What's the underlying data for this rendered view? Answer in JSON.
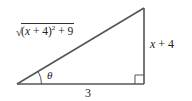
{
  "figure": {
    "type": "right-triangle",
    "labels": {
      "hypotenuse": {
        "radical_open": "√",
        "paren_open": "(",
        "var": "x",
        "plus1": " + ",
        "num": "4",
        "paren_close": ")",
        "exponent": "2",
        "plus2": " + ",
        "const": "9",
        "full_text": "√((x + 4)² + 9)"
      },
      "opposite": {
        "var": "x",
        "rest": " + 4",
        "full_text": "x + 4"
      },
      "adjacent": "3",
      "angle": "θ"
    },
    "vertices": {
      "left": [
        17,
        84
      ],
      "right_angle": [
        144,
        84
      ],
      "top": [
        144,
        8
      ]
    },
    "colors": {
      "stroke": "#555555",
      "text": "#222222",
      "background": "#ffffff"
    }
  }
}
